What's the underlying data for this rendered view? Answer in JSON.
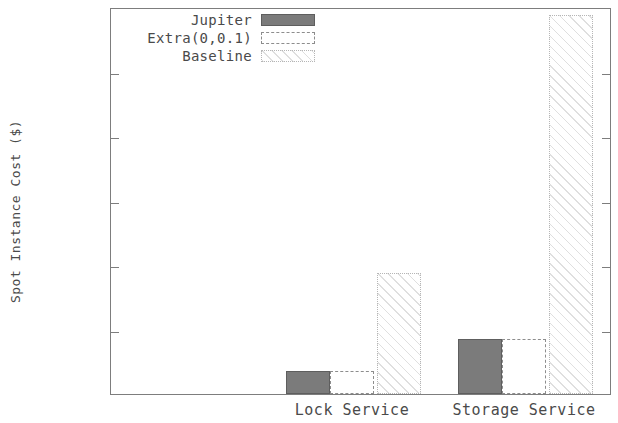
{
  "chart_data": {
    "type": "bar",
    "title": "",
    "xlabel": "",
    "ylabel": "Spot Instance Cost ($)",
    "categories": [
      "Lock Service",
      "Storage Service"
    ],
    "series": [
      {
        "name": "Jupiter",
        "values": [
          7,
          17
        ]
      },
      {
        "name": "Extra(0,0.1)",
        "values": [
          7,
          17
        ]
      },
      {
        "name": "Baseline",
        "values": [
          37.5,
          117.5
        ]
      }
    ],
    "ylim": [
      0,
      120
    ],
    "yticks": [
      0,
      20,
      40,
      60,
      80,
      100,
      120
    ],
    "ytick_labels": [
      "0",
      "20",
      "40",
      "60",
      "80",
      "100",
      "120"
    ],
    "grid": false,
    "legend_position": "top-center",
    "colors": {
      "jupiter": "#7b7b7b",
      "extra": "#ffffff",
      "baseline": "#ffffff",
      "axis": "#7d7d7d",
      "text": "#4a4a4a",
      "background": "#ffffff"
    }
  }
}
